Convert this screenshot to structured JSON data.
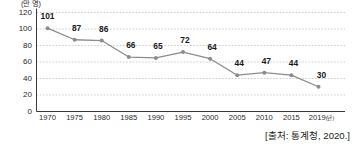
{
  "chart_data": {
    "type": "line",
    "title": "",
    "subtitle": "",
    "xlabel": "(년)",
    "ylabel": "(만 명)",
    "unit_label": "(만 명)",
    "x_axis_suffix": "(년)",
    "categories": [
      "1970",
      "1975",
      "1980",
      "1985",
      "1990",
      "1995",
      "2000",
      "2005",
      "2010",
      "2015",
      "2019"
    ],
    "values": [
      101,
      87,
      86,
      66,
      65,
      72,
      64,
      44,
      47,
      44,
      30
    ],
    "data_labels": [
      "101",
      "87",
      "86",
      "66",
      "65",
      "72",
      "64",
      "44",
      "47",
      "44",
      "30"
    ],
    "xticklabels": [
      "1970",
      "1975",
      "1980",
      "1985",
      "1990",
      "1995",
      "2000",
      "2005",
      "2010",
      "2015",
      "2019"
    ],
    "yticklabels": [
      "0",
      "20",
      "40",
      "60",
      "80",
      "100",
      "120"
    ],
    "yticks": [
      0,
      20,
      40,
      60,
      80,
      100,
      120
    ],
    "ylim": [
      0,
      120
    ],
    "grid": true,
    "grid_style": "dashed",
    "legend": "none",
    "series_color": "#8c8c8c",
    "marker_color": "#8c8c8c",
    "axis_color": "#3a3a3a",
    "grid_color": "#b8b8b8",
    "text_color": "#231f20"
  },
  "source": {
    "text": "[출처: 통계청, 2020.]"
  }
}
